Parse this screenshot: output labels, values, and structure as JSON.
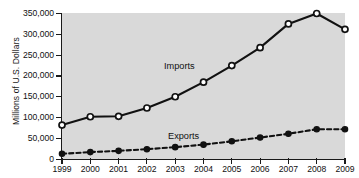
{
  "chart_data": {
    "type": "line",
    "title": "",
    "xlabel": "",
    "ylabel": "Millions of U.S. Dollars",
    "categories": [
      "1999",
      "2000",
      "2001",
      "2002",
      "2003",
      "2004",
      "2005",
      "2006",
      "2007",
      "2008",
      "2009"
    ],
    "x": [
      1999,
      2000,
      2001,
      2002,
      2003,
      2004,
      2005,
      2006,
      2007,
      2008,
      2009
    ],
    "xlim": [
      1999,
      2009
    ],
    "ylim": [
      0,
      350000
    ],
    "yticks": [
      0,
      50000,
      100000,
      150000,
      200000,
      250000,
      300000,
      350000
    ],
    "ytick_labels": [
      "0",
      "50,000",
      "100,000",
      "150,000",
      "200,000",
      "250,000",
      "300,000",
      "350,000"
    ],
    "grid": false,
    "legend_position": "inline-annotation",
    "series": [
      {
        "name": "Imports",
        "values": [
          82000,
          102000,
          103000,
          123000,
          150000,
          185000,
          225000,
          268000,
          325000,
          350000,
          312000
        ],
        "marker": "open-circle",
        "linestyle": "solid"
      },
      {
        "name": "Exports",
        "values": [
          13000,
          17000,
          20000,
          24000,
          29000,
          35000,
          43000,
          52000,
          61000,
          72000,
          72000
        ],
        "marker": "filled-circle",
        "linestyle": "dashed"
      }
    ],
    "annotations": [
      {
        "text": "Imports",
        "series": "Imports"
      },
      {
        "text": "Exports",
        "series": "Exports"
      }
    ]
  },
  "colors": {
    "plot_background": "#d9d9d9",
    "page_background": "#ffffff",
    "axis": "#1a1a1a",
    "series_stroke": "#111111",
    "imports_marker_fill": "#ffffff",
    "exports_marker_fill": "#111111"
  }
}
